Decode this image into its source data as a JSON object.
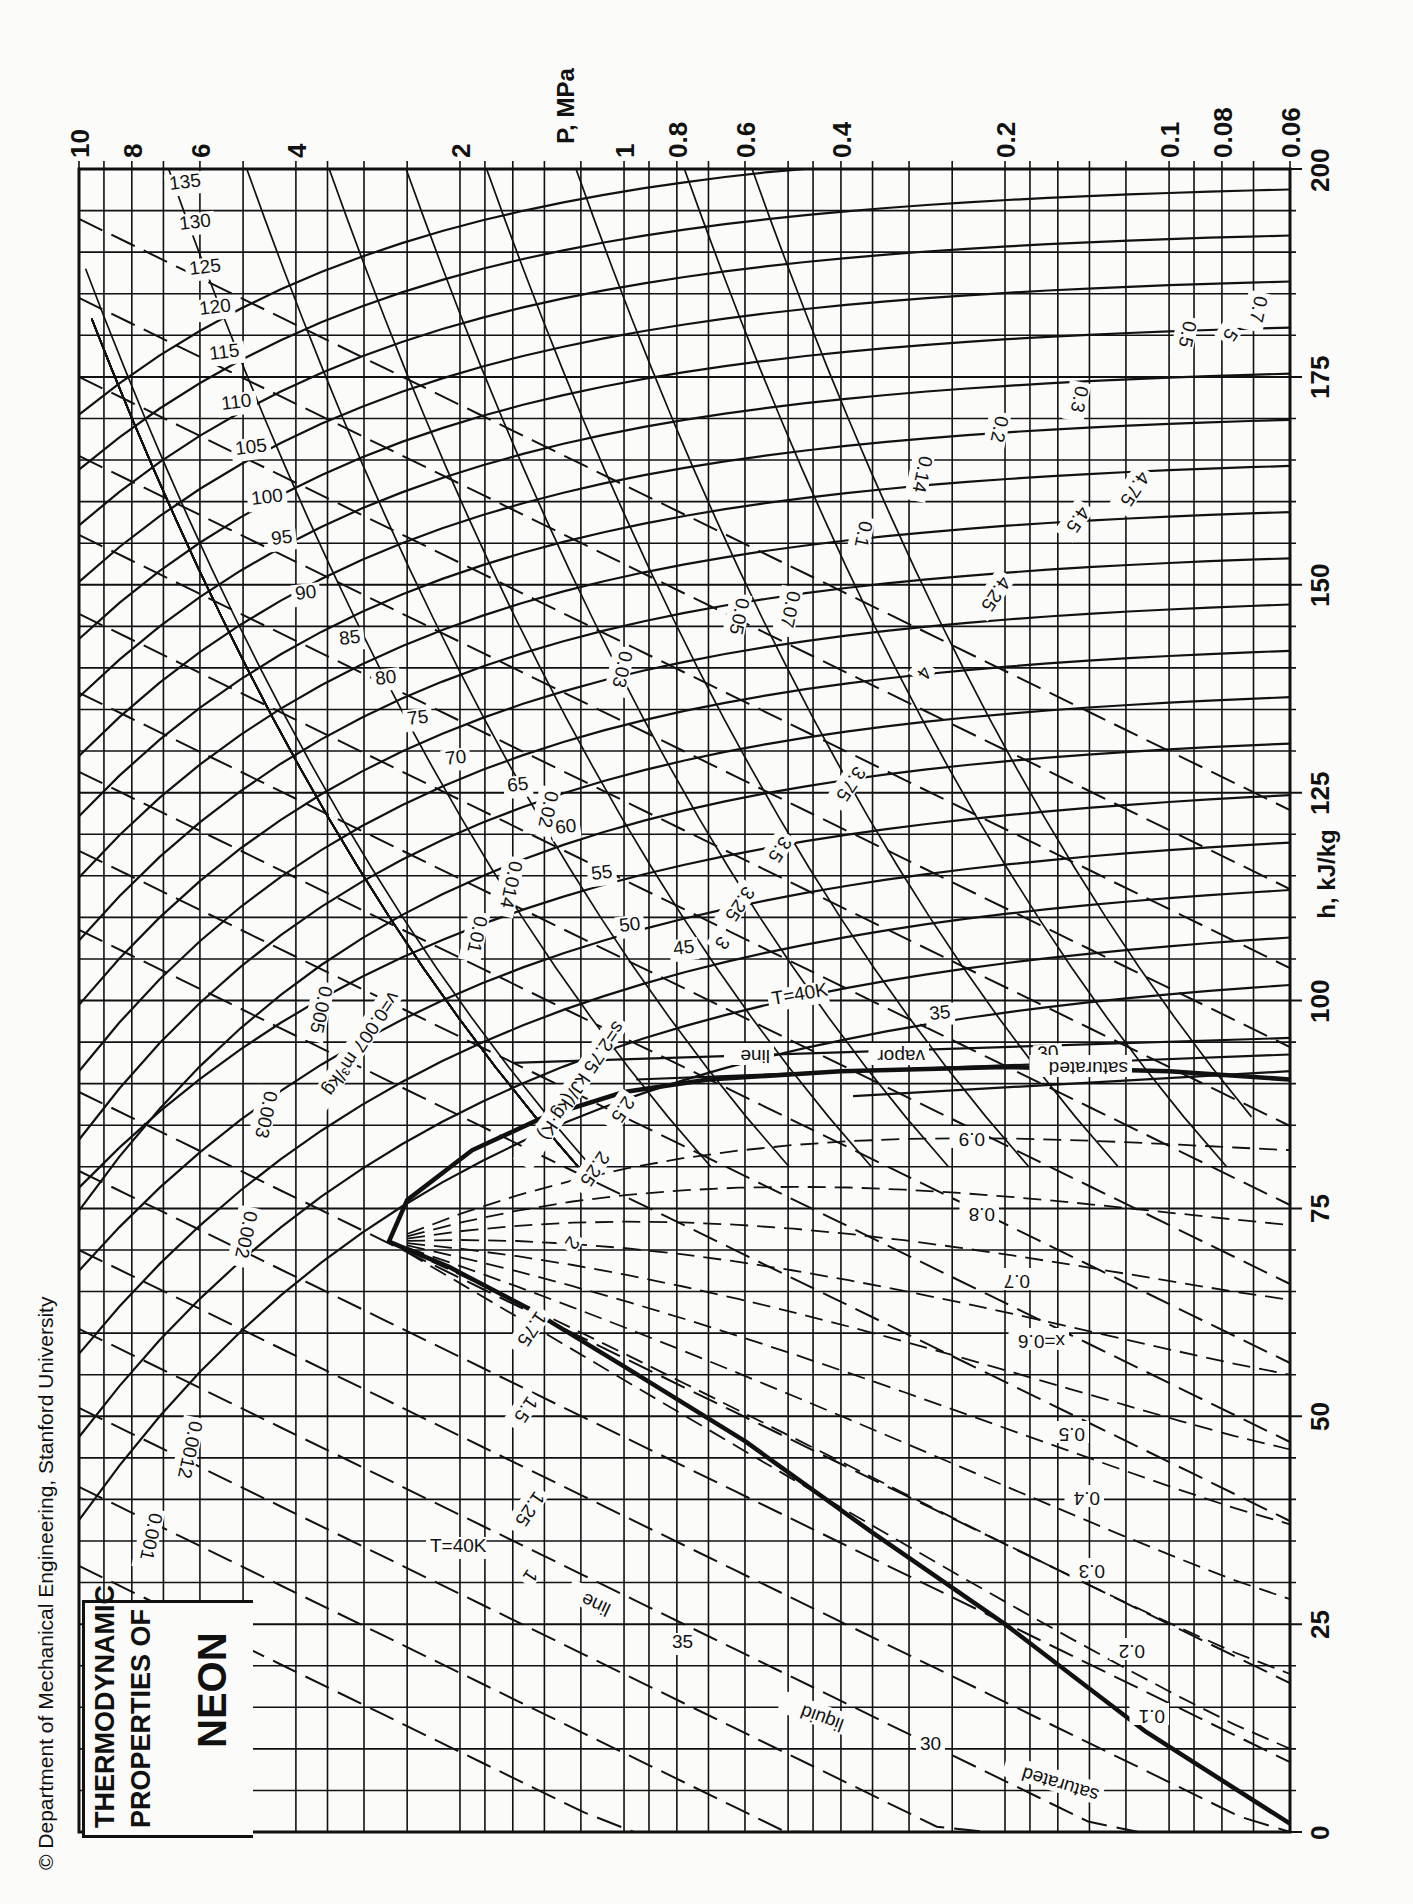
{
  "title": {
    "line1": "THERMODYNAMIC",
    "line2": "PROPERTIES OF",
    "substance": "NEON"
  },
  "copyright": "© Department of Mechanical Engineering, Stanford University",
  "colors": {
    "ink": "#111111",
    "paper": "#fbfbfa"
  },
  "chart_data": {
    "type": "line",
    "xlabel": "h, kJ/kg",
    "ylabel": "P, MPa",
    "orientation_note": "page rotated 90°: h axis runs bottom-to-top, P axis (log) runs right-to-left",
    "h_range": [
      0,
      200
    ],
    "P_range": [
      0.06,
      10
    ],
    "P_scale": "log",
    "grid": true,
    "h_ticks": [
      0,
      25,
      50,
      75,
      100,
      125,
      150,
      175,
      200
    ],
    "P_ticks": [
      "10",
      "8",
      "6",
      "4",
      "2",
      "1",
      "0.8",
      "0.6",
      "0.4",
      "0.2",
      "0.1",
      "0.08",
      "0.06"
    ],
    "P_tick_values": [
      10,
      8,
      6,
      4,
      2,
      1,
      0.8,
      0.6,
      0.4,
      0.2,
      0.1,
      0.08,
      0.06
    ],
    "saturation_dome": {
      "liquid_label": "saturated liquid line",
      "vapor_label": "saturated vapor line",
      "critical_point": {
        "h": 71,
        "P": 2.7
      },
      "liquid": [
        [
          1,
          0.06
        ],
        [
          12,
          0.11
        ],
        [
          25,
          0.2
        ],
        [
          36,
          0.35
        ],
        [
          47,
          0.6
        ],
        [
          56,
          1.0
        ],
        [
          63,
          1.5
        ],
        [
          68,
          2.1
        ],
        [
          71,
          2.7
        ]
      ],
      "vapor": [
        [
          71,
          2.7
        ],
        [
          76,
          2.5
        ],
        [
          82,
          1.9
        ],
        [
          86,
          1.4
        ],
        [
          89,
          1.0
        ],
        [
          90.5,
          0.7
        ],
        [
          91.5,
          0.4
        ],
        [
          92,
          0.2
        ],
        [
          91.5,
          0.1
        ],
        [
          90.5,
          0.06
        ]
      ]
    },
    "isotherms_K": {
      "label_prefix": "T=",
      "unit": "K",
      "values": [
        30,
        35,
        40,
        45,
        50,
        55,
        60,
        65,
        70,
        75,
        80,
        85,
        90,
        95,
        100,
        105,
        110,
        115,
        120,
        125,
        130,
        135
      ],
      "liquid_labels": [
        {
          "T": 30,
          "h": 25
        },
        {
          "T": 35,
          "h": 31
        },
        {
          "T": 40,
          "h": 36
        }
      ]
    },
    "isochores_m3_per_kg": {
      "label": "v = 0.007 m³/kg",
      "values": [
        0.001,
        0.0012,
        0.002,
        0.003,
        0.005,
        0.007,
        0.01,
        0.014,
        0.02,
        0.03,
        0.05,
        0.07,
        0.1,
        0.14,
        0.2,
        0.3,
        0.5,
        0.7
      ]
    },
    "isentropes_kJ_per_kgK": {
      "label": "s = 2.75 kJ/(kg·K)",
      "values": [
        1,
        1.25,
        1.5,
        1.75,
        2,
        2.25,
        2.5,
        2.75,
        3,
        3.25,
        3.5,
        3.75,
        4,
        4.25,
        4.5,
        4.75,
        5
      ]
    },
    "quality_lines": {
      "label": "x = 0.6",
      "values": [
        0.1,
        0.2,
        0.3,
        0.4,
        0.5,
        0.6,
        0.7,
        0.8,
        0.9
      ]
    },
    "labels": {
      "sat_liquid": [
        "saturated",
        "liquid",
        "line"
      ],
      "sat_vapor": [
        "saturated",
        "vapor",
        "line"
      ],
      "T40": "T=40K",
      "v_main": "v=0.007 m³/kg",
      "s_main": "s=2.75 kJ/(kg·K)",
      "x_main": "x=0.6"
    }
  }
}
